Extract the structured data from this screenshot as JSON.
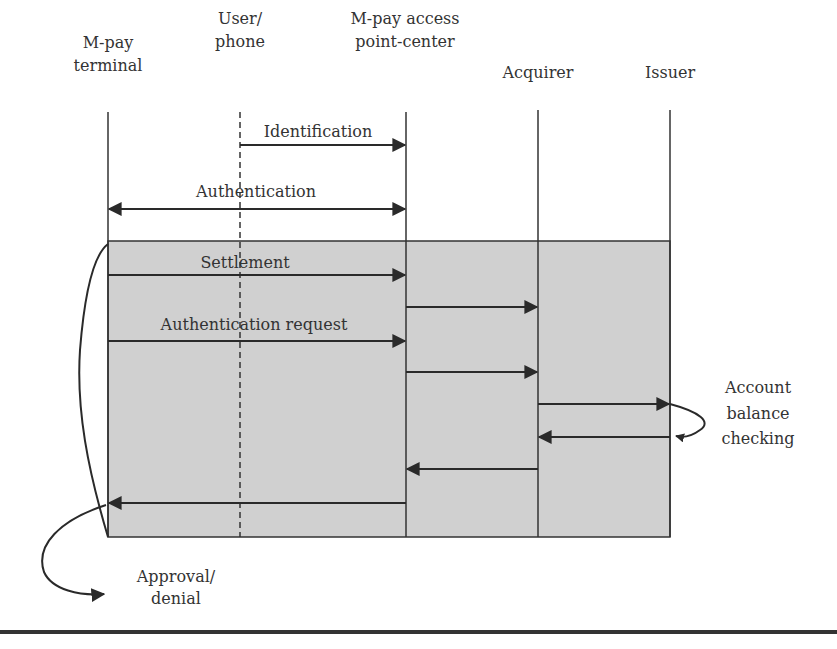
{
  "participants": [
    {
      "id": "terminal",
      "line1": "M-pay",
      "line2": "terminal"
    },
    {
      "id": "user",
      "line1": "User/",
      "line2": "phone"
    },
    {
      "id": "center",
      "line1": "M-pay access",
      "line2": "point-center"
    },
    {
      "id": "acquirer",
      "line1": "Acquirer",
      "line2": ""
    },
    {
      "id": "issuer",
      "line1": "Issuer",
      "line2": ""
    }
  ],
  "messages": [
    {
      "label": "Identification",
      "from": "user",
      "to": "center",
      "direction": "right"
    },
    {
      "label": "Authentication",
      "from": "terminal",
      "to": "center",
      "direction": "both"
    },
    {
      "label": "Settlement",
      "from": "terminal",
      "to": "center",
      "direction": "right"
    },
    {
      "label": "",
      "from": "center",
      "to": "acquirer",
      "direction": "right"
    },
    {
      "label": "Authentication request",
      "from": "terminal",
      "to": "center",
      "direction": "right"
    },
    {
      "label": "",
      "from": "center",
      "to": "acquirer",
      "direction": "right"
    },
    {
      "label": "",
      "from": "acquirer",
      "to": "issuer",
      "direction": "right"
    },
    {
      "label": "",
      "from": "issuer",
      "to": "acquirer",
      "direction": "left"
    },
    {
      "label": "",
      "from": "acquirer",
      "to": "center",
      "direction": "left"
    },
    {
      "label": "",
      "from": "center",
      "to": "terminal",
      "direction": "left"
    }
  ],
  "annotations": {
    "balance": {
      "line1": "Account",
      "line2": "balance",
      "line3": "checking"
    },
    "result": {
      "line1": "Approval/",
      "line2": "denial"
    }
  },
  "colors": {
    "shaded_region": "#d0d0d0",
    "lines": "#2a2a2a",
    "text": "#333333"
  }
}
